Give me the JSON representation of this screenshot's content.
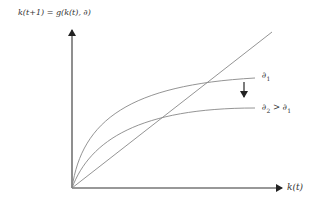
{
  "diagram": {
    "y_axis_label": "k(t+1) = g(k(t), ∂)",
    "x_axis_label": "k(t)",
    "curves": [
      {
        "name": "upper-curve",
        "label_main": "∂",
        "label_sub": "1",
        "label_rest": ""
      },
      {
        "name": "lower-curve",
        "label_main": "∂",
        "label_sub": "2",
        "label_rest": " > ∂",
        "label_sub2": "1"
      }
    ],
    "line_45": "45-degree line",
    "shift_arrow": "downward shift"
  }
}
